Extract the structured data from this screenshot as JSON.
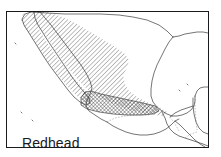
{
  "figure": {
    "kind": "species-range-map",
    "width": 221,
    "height": 157,
    "background_color": "#ffffff",
    "frame": {
      "border_color": "#1a1a1a",
      "border_width": 1,
      "x": 6,
      "y": 11,
      "width": 203,
      "height": 137
    }
  },
  "label": {
    "species_name": "Redhead"
  },
  "map": {
    "region_description": "Mexico and Central America",
    "coastline_color": "#3a3a3a",
    "coastline_width": 0.7,
    "border_color": "#5a5a5a",
    "land_fill": "#ffffff",
    "water_fill": "#ffffff"
  },
  "legend_patterns": [
    {
      "id": "single-hatch",
      "name": "wintering-range-hatch",
      "description": "diagonal hatching over northern and central Mexico",
      "color": "#2a2a2a",
      "angle_deg": 45,
      "spacing_px": 3.2,
      "line_width": 0.55
    },
    {
      "id": "cross-hatch",
      "name": "core-range-crosshatch",
      "description": "dense cross-hatched core band across central-southwest Mexico",
      "color": "#1a1a1a",
      "angle_deg": 45,
      "spacing_px": 2.6,
      "line_width": 0.6
    }
  ]
}
